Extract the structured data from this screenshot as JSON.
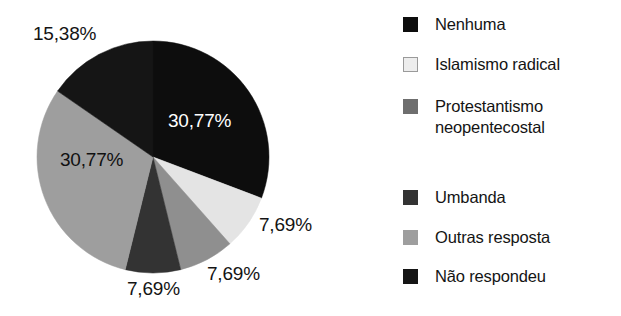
{
  "chart_data": {
    "type": "pie",
    "title": "",
    "subtitle": "",
    "xlabel": "",
    "ylabel": "",
    "legend_position": "right",
    "grid": false,
    "decimal_separator": ",",
    "value_suffix": "%",
    "start_angle_deg": 0,
    "direction": "clockwise",
    "categories": [
      "Nenhuma",
      "Islamismo radical",
      "Protestantismo neopentecostal",
      "Umbanda",
      "Outras resposta",
      "Não respondeu"
    ],
    "values": [
      30.77,
      7.69,
      7.69,
      7.69,
      30.77,
      15.38
    ],
    "labels": [
      "30,77%",
      "7,69%",
      "7,69%",
      "7,69%",
      "30,77%",
      "15,38%"
    ],
    "colors": [
      "#0d0d0d",
      "#e4e4e4",
      "#8f8f8f",
      "#333333",
      "#9e9e9e",
      "#151515"
    ],
    "slices": [
      {
        "name": "Nenhuma",
        "value": 30.77,
        "label": "30,77%",
        "color": "#0d0d0d",
        "label_color": "#ffffff",
        "label_placement": "inside"
      },
      {
        "name": "Islamismo radical",
        "value": 7.69,
        "label": "7,69%",
        "color": "#e4e4e4",
        "label_color": "#141414",
        "label_placement": "outside"
      },
      {
        "name": "Protestantismo neopentecostal",
        "value": 7.69,
        "label": "7,69%",
        "color": "#8f8f8f",
        "label_color": "#141414",
        "label_placement": "outside"
      },
      {
        "name": "Umbanda",
        "value": 7.69,
        "label": "7,69%",
        "color": "#333333",
        "label_color": "#141414",
        "label_placement": "outside"
      },
      {
        "name": "Outras resposta",
        "value": 30.77,
        "label": "30,77%",
        "color": "#9e9e9e",
        "label_color": "#111111",
        "label_placement": "inside"
      },
      {
        "name": "Não respondeu",
        "value": 15.38,
        "label": "15,38%",
        "color": "#151515",
        "label_color": "#141414",
        "label_placement": "outside"
      }
    ]
  },
  "legend": {
    "items": [
      {
        "label": "Nenhuma",
        "color": "#0d0d0d",
        "border": "#0d0d0d"
      },
      {
        "label": "Islamismo radical",
        "color": "#ededed",
        "border": "#9a9a9a"
      },
      {
        "label": "Protestantismo\nneopentecostal",
        "color": "#6e6e6e",
        "border": "#6e6e6e"
      },
      {
        "label": "Umbanda",
        "color": "#333333",
        "border": "#333333"
      },
      {
        "label": "Outras resposta",
        "color": "#9e9e9e",
        "border": "#9e9e9e"
      },
      {
        "label": "Não respondeu",
        "color": "#151515",
        "border": "#151515"
      }
    ]
  },
  "style": {
    "background": "#ffffff",
    "text_color": "#141414"
  }
}
